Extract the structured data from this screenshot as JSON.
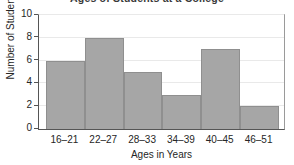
{
  "chart_data": {
    "type": "bar",
    "title": "Ages of Students at a College",
    "categories": [
      "16–21",
      "22–27",
      "28–33",
      "34–39",
      "40–45",
      "46–51"
    ],
    "values": [
      6,
      8,
      5,
      3,
      7,
      2
    ],
    "xlabel": "Ages in Years",
    "ylabel": "Number of Students",
    "ylim": [
      0,
      10
    ],
    "yticks": [
      0,
      2,
      4,
      6,
      8,
      10
    ],
    "ytick_labels": [
      "0",
      "2",
      "4",
      "6",
      "8",
      "10"
    ],
    "grid": true,
    "legend": "none",
    "bar_color": "#a6a6a6",
    "bar_edge_color": "#8f8f8f",
    "axis_color": "#555555",
    "gridline_color": "#e9e9e9",
    "background_color": "#ffffff",
    "text_color": "#262626"
  }
}
